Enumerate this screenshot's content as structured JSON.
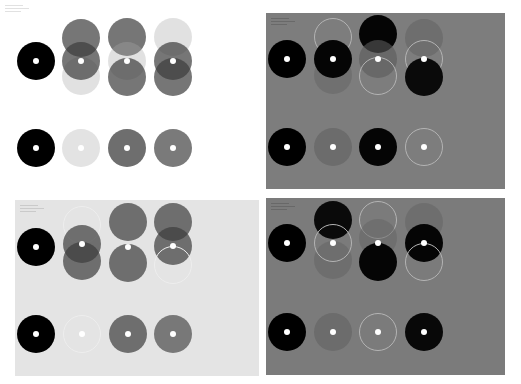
{
  "figure": {
    "circle_radius": 19,
    "panels": [
      {
        "id": "top-left",
        "background": "#ffffff",
        "box": {
          "x": 0,
          "y": 0,
          "w": 262,
          "h": 192
        },
        "label_color": "#c8c8c8",
        "label_lines": 3,
        "circles": [
          {
            "x": 36,
            "y": 61,
            "fill": "#000000",
            "dot": true
          },
          {
            "x": 81,
            "y": 38,
            "fill": "rgba(60,60,60,0.7)"
          },
          {
            "x": 81,
            "y": 76,
            "fill": "rgba(170,170,170,0.35)"
          },
          {
            "x": 81,
            "y": 61,
            "fill": "rgba(60,60,60,0.7)",
            "dot": true
          },
          {
            "x": 127,
            "y": 37,
            "fill": "rgba(60,60,60,0.7)"
          },
          {
            "x": 127,
            "y": 61,
            "fill": "rgba(170,170,170,0.35)",
            "dot": true
          },
          {
            "x": 127,
            "y": 77,
            "fill": "rgba(60,60,60,0.7)"
          },
          {
            "x": 173,
            "y": 37,
            "fill": "rgba(170,170,170,0.35)"
          },
          {
            "x": 173,
            "y": 61,
            "fill": "rgba(60,60,60,0.7)",
            "dot": true
          },
          {
            "x": 173,
            "y": 77,
            "fill": "rgba(60,60,60,0.7)"
          },
          {
            "x": 36,
            "y": 148,
            "fill": "#000000",
            "dot": true
          },
          {
            "x": 81,
            "y": 148,
            "fill": "#e3e3e3",
            "dot": true
          },
          {
            "x": 127,
            "y": 148,
            "fill": "#6e6e6e",
            "dot": true
          },
          {
            "x": 173,
            "y": 148,
            "fill": "#7a7a7a",
            "dot": true
          }
        ]
      },
      {
        "id": "top-right",
        "background": "#7d7d7d",
        "box": {
          "x": 266,
          "y": 13,
          "w": 239,
          "h": 176
        },
        "label_color": "#5a5a5a",
        "label_lines": 3,
        "circles": [
          {
            "x": 21,
            "y": 46,
            "fill": "#000000",
            "dot": true
          },
          {
            "x": 67,
            "y": 24,
            "fill": "transparent",
            "stroke": "#b4b4b4"
          },
          {
            "x": 67,
            "y": 62,
            "fill": "rgba(100,100,100,0.5)"
          },
          {
            "x": 67,
            "y": 46,
            "fill": "#050505",
            "dot": true
          },
          {
            "x": 112,
            "y": 21,
            "fill": "#050505"
          },
          {
            "x": 112,
            "y": 46,
            "fill": "rgba(90,90,90,0.6)",
            "dot": true
          },
          {
            "x": 112,
            "y": 63,
            "fill": "transparent",
            "stroke": "#b4b4b4"
          },
          {
            "x": 158,
            "y": 25,
            "fill": "rgba(100,100,100,0.6)"
          },
          {
            "x": 158,
            "y": 46,
            "fill": "transparent",
            "stroke": "#b4b4b4",
            "dot": true
          },
          {
            "x": 158,
            "y": 64,
            "fill": "#0a0a0a"
          },
          {
            "x": 21,
            "y": 134,
            "fill": "#000000",
            "dot": true
          },
          {
            "x": 67,
            "y": 134,
            "fill": "#6c6c6c",
            "dot": true
          },
          {
            "x": 112,
            "y": 134,
            "fill": "#050505",
            "dot": true
          },
          {
            "x": 158,
            "y": 134,
            "fill": "transparent",
            "stroke": "#b4b4b4",
            "dot": true
          }
        ]
      },
      {
        "id": "bottom-left",
        "background": "#e4e4e4",
        "box": {
          "x": 15,
          "y": 200,
          "w": 244,
          "h": 176
        },
        "label_color": "#b4b4b4",
        "label_lines": 3,
        "circles": [
          {
            "x": 21,
            "y": 47,
            "fill": "#000000",
            "dot": true
          },
          {
            "x": 67,
            "y": 25,
            "fill": "transparent",
            "stroke": "#eeeeee"
          },
          {
            "x": 67,
            "y": 44,
            "fill": "rgba(60,60,60,0.7)",
            "dot": true
          },
          {
            "x": 67,
            "y": 61,
            "fill": "rgba(60,60,60,0.7)"
          },
          {
            "x": 113,
            "y": 22,
            "fill": "rgba(60,60,60,0.7)"
          },
          {
            "x": 113,
            "y": 63,
            "fill": "rgba(60,60,60,0.7)"
          },
          {
            "x": 113,
            "y": 47,
            "fill": "transparent",
            "dot": true
          },
          {
            "x": 158,
            "y": 22,
            "fill": "rgba(60,60,60,0.7)"
          },
          {
            "x": 158,
            "y": 46,
            "fill": "rgba(60,60,60,0.7)",
            "dot": true
          },
          {
            "x": 158,
            "y": 65,
            "fill": "transparent",
            "stroke": "#eeeeee"
          },
          {
            "x": 21,
            "y": 134,
            "fill": "#000000",
            "dot": true
          },
          {
            "x": 67,
            "y": 134,
            "fill": "transparent",
            "stroke": "#eeeeee",
            "dot": true
          },
          {
            "x": 113,
            "y": 134,
            "fill": "#6e6e6e",
            "dot": true
          },
          {
            "x": 158,
            "y": 134,
            "fill": "#787878",
            "dot": true
          }
        ]
      },
      {
        "id": "bottom-right",
        "background": "#7b7b7b",
        "box": {
          "x": 266,
          "y": 198,
          "w": 239,
          "h": 177
        },
        "label_color": "#5a5a5a",
        "label_lines": 3,
        "circles": [
          {
            "x": 21,
            "y": 45,
            "fill": "#000000",
            "dot": true
          },
          {
            "x": 67,
            "y": 22,
            "fill": "#0a0a0a"
          },
          {
            "x": 67,
            "y": 62,
            "fill": "rgba(100,100,100,0.55)"
          },
          {
            "x": 67,
            "y": 45,
            "fill": "transparent",
            "stroke": "#b4b4b4",
            "dot": true
          },
          {
            "x": 112,
            "y": 22,
            "fill": "transparent",
            "stroke": "#b4b4b4"
          },
          {
            "x": 112,
            "y": 40,
            "fill": "rgba(100,100,100,0.5)"
          },
          {
            "x": 112,
            "y": 64,
            "fill": "#050505",
            "dot": true,
            "dot_y": 45
          },
          {
            "x": 158,
            "y": 24,
            "fill": "rgba(100,100,100,0.55)"
          },
          {
            "x": 158,
            "y": 45,
            "fill": "#050505",
            "dot": true
          },
          {
            "x": 158,
            "y": 64,
            "fill": "transparent",
            "stroke": "#b4b4b4"
          },
          {
            "x": 21,
            "y": 134,
            "fill": "#000000",
            "dot": true
          },
          {
            "x": 67,
            "y": 134,
            "fill": "#6c6c6c",
            "dot": true
          },
          {
            "x": 112,
            "y": 134,
            "fill": "transparent",
            "stroke": "#b4b4b4",
            "dot": true
          },
          {
            "x": 158,
            "y": 134,
            "fill": "#080808",
            "dot": true
          }
        ]
      }
    ]
  }
}
